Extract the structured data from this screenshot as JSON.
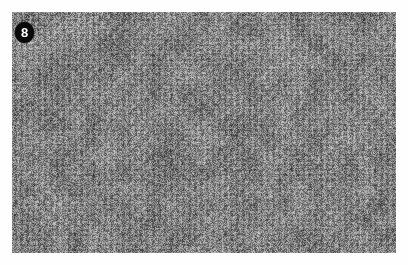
{
  "figure": {
    "panel_label": "8",
    "badge_shape": "filled-circle",
    "badge_background_color": "#0a0a0a",
    "badge_text_color": "#ffffff",
    "page_background_color": "#fefefe"
  },
  "plate": {
    "alt_text": "Grayscale close-up photograph of a fine-grained woven knit fabric texture",
    "subject": "fabric-texture",
    "color_mode": "grayscale",
    "mean_gray": "#808080",
    "dark_gray": "#2f2f2f",
    "light_gray": "#d4d4d4",
    "left": 12,
    "top": 12,
    "width": 384,
    "height": 241
  },
  "chart_data": {
    "type": "heatmap",
    "title": "",
    "xlabel": "",
    "ylabel": "",
    "grid": false,
    "legend": "none",
    "colormap": "gray",
    "value_range": [
      0,
      255
    ],
    "dominant_value": 128,
    "texture_period_x_px": 6,
    "texture_period_y_px": 5
  }
}
